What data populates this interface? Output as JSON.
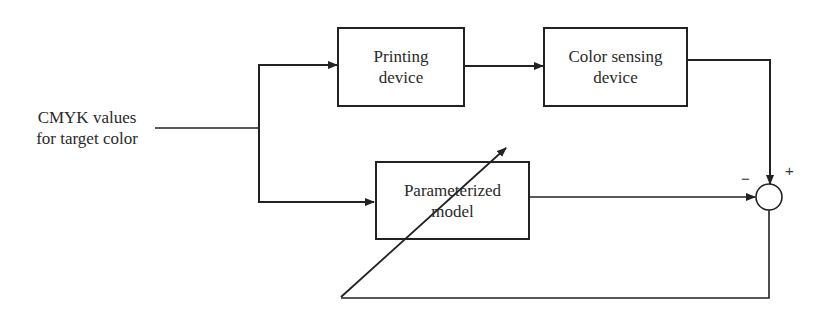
{
  "diagram": {
    "type": "block-diagram",
    "input": {
      "label_line1": "CMYK values",
      "label_line2": "for target color"
    },
    "blocks": [
      {
        "id": "printing",
        "line1": "Printing",
        "line2": "device"
      },
      {
        "id": "sensing",
        "line1": "Color sensing",
        "line2": "device"
      },
      {
        "id": "model",
        "line1": "Parameterized",
        "line2": "model"
      }
    ],
    "summing_junction": {
      "minus_sign": "−",
      "plus_sign": "+"
    },
    "colors": {
      "stroke": "#222222",
      "background": "#ffffff"
    }
  }
}
